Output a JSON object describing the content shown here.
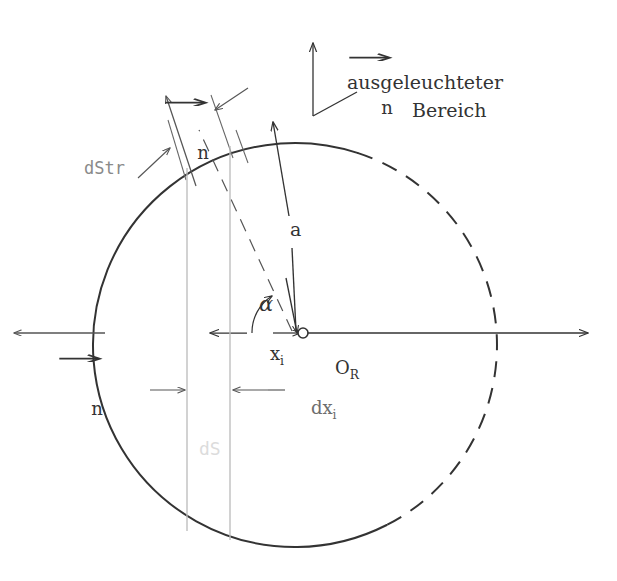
{
  "figure": {
    "type": "technical-diagram",
    "background_color": "#ffffff",
    "line_color": "#333333",
    "gray_line_color": "#b9b9b9",
    "faint_label_color": "#dcdcdc",
    "gray_label_color": "#8a8a8a"
  },
  "labels": {
    "region_line1": "ausgeleuchteter",
    "region_line2": "Bereich",
    "normal_top": "n",
    "normal_surface": "n",
    "normal_left": "n",
    "radius": "a",
    "angle": "α",
    "center": "O",
    "center_sub": "R",
    "x_i": "x",
    "x_i_sub": "i",
    "dx_i": "dx",
    "dx_i_sub": "i",
    "dStr": "dStr",
    "dS": "dS"
  },
  "geometry": {
    "center": {
      "x": 295,
      "y": 345
    },
    "radius": 202,
    "solid_arc_note": "left hemisphere solid, right hemisphere dashed",
    "dashed_start_deg": -63,
    "dashed_end_deg": 72,
    "vertical_line_1_x": 187,
    "vertical_line_2_x": 230,
    "axis_arrow_right_x": 588,
    "axis_arrow_left_x": 12,
    "axis_y": 333,
    "alpha_deg": 63
  },
  "annotations": [
    {
      "name": "ausgeleuchteter-bereich",
      "text": "ausgeleuchteter Bereich",
      "kind": "leader-label"
    },
    {
      "name": "normal-top",
      "text": "n",
      "kind": "vector-label"
    },
    {
      "name": "normal-surface",
      "text": "n",
      "kind": "vector-label"
    },
    {
      "name": "normal-left",
      "text": "n",
      "kind": "vector-label"
    },
    {
      "name": "radius-a",
      "text": "a",
      "kind": "dimension-label"
    },
    {
      "name": "angle-alpha",
      "text": "α",
      "kind": "angle-label"
    },
    {
      "name": "center-or",
      "text": "O_R",
      "kind": "point-label"
    },
    {
      "name": "x-i",
      "text": "x_i",
      "kind": "dimension-label"
    },
    {
      "name": "dx-i",
      "text": "dx_i",
      "kind": "dimension-label"
    },
    {
      "name": "d-str",
      "text": "dStr",
      "kind": "dimension-label"
    },
    {
      "name": "d-s",
      "text": "dS",
      "kind": "area-label"
    }
  ]
}
